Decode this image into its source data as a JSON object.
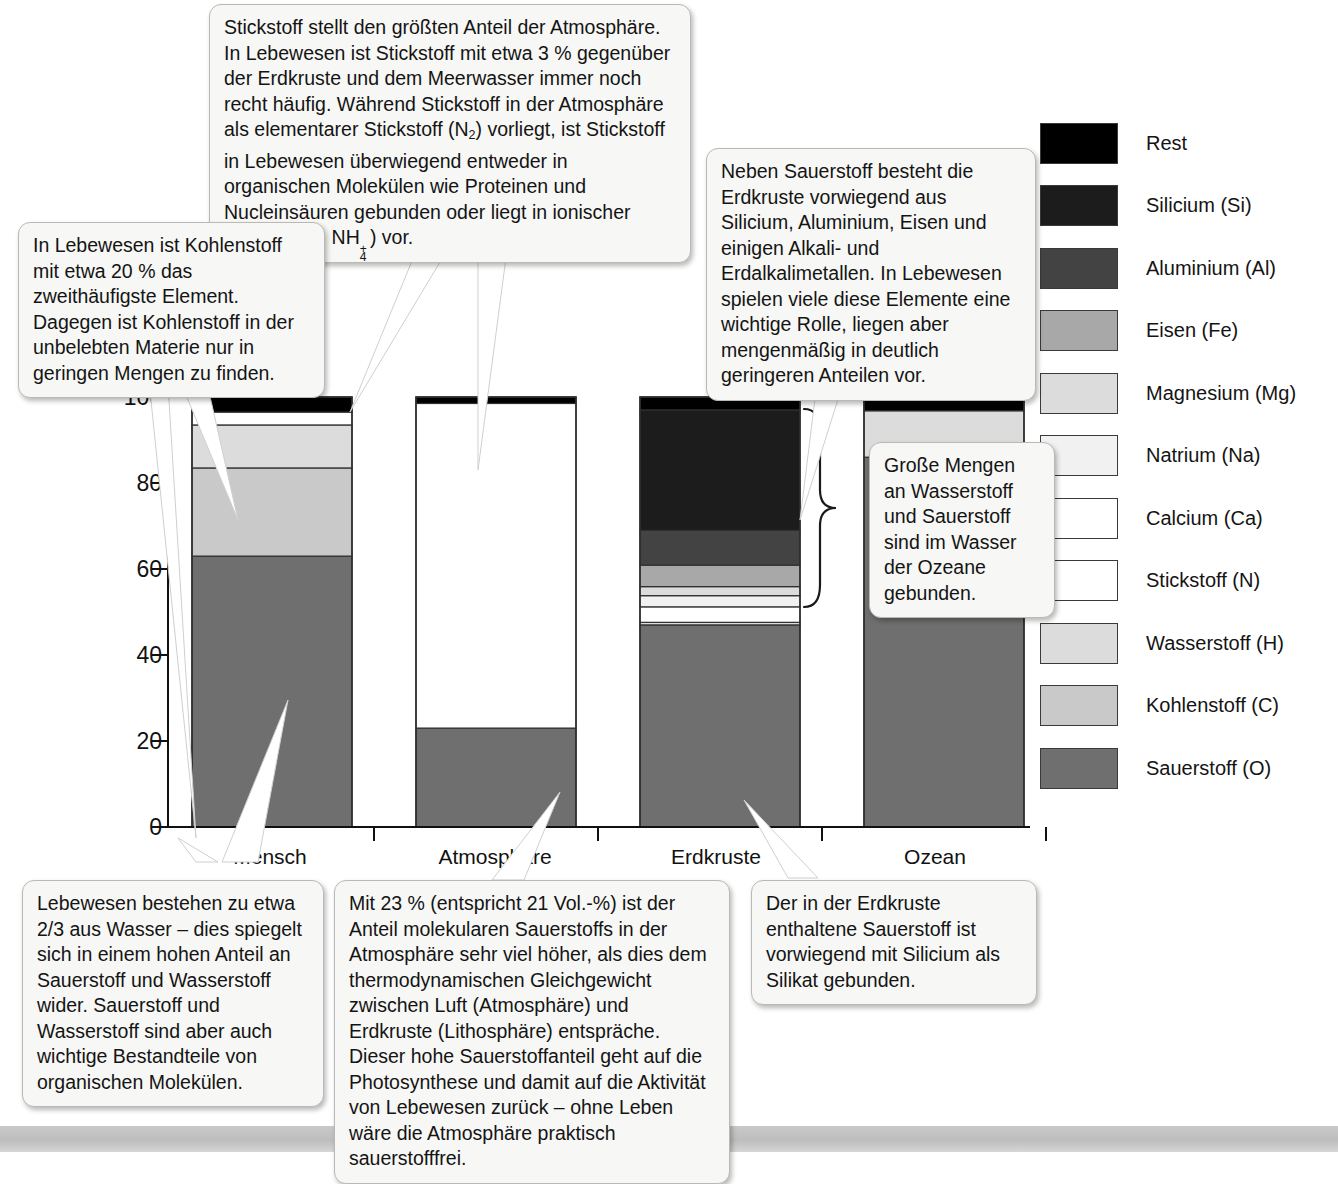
{
  "chart_data": {
    "type": "bar",
    "subtype": "stacked-100-percent",
    "title": "",
    "xlabel": "",
    "ylabel": "",
    "ylim": [
      0,
      100
    ],
    "yticks": [
      0,
      20,
      40,
      60,
      80,
      100
    ],
    "grid": false,
    "legend_position": "right",
    "categories": [
      "Mensch",
      "Atmosphäre",
      "Erdkruste",
      "Ozean"
    ],
    "series": [
      {
        "name": "Sauerstoff (O)",
        "color": "#6f6f6f",
        "values": [
          63.0,
          23.0,
          47.0,
          86.0
        ]
      },
      {
        "name": "Kohlenstoff (C)",
        "color": "#c9c9c9",
        "values": [
          20.5,
          0.0,
          0.0,
          0.0
        ]
      },
      {
        "name": "Wasserstoff (H)",
        "color": "#dcdcdc",
        "values": [
          10.0,
          0.0,
          0.6,
          10.8
        ]
      },
      {
        "name": "Stickstoff (N)",
        "color": "#ffffff",
        "values": [
          3.0,
          75.5,
          0.0,
          0.0
        ]
      },
      {
        "name": "Calcium (Ca)",
        "color": "#ffffff",
        "values": [
          0.0,
          0.0,
          3.6,
          0.0
        ]
      },
      {
        "name": "Natrium (Na)",
        "color": "#f1f1f1",
        "values": [
          0.0,
          0.0,
          2.6,
          0.0
        ]
      },
      {
        "name": "Magnesium (Mg)",
        "color": "#dcdcdc",
        "values": [
          0.0,
          0.0,
          2.1,
          0.0
        ]
      },
      {
        "name": "Eisen (Fe)",
        "color": "#a8a8a8",
        "values": [
          0.0,
          0.0,
          5.0,
          0.0
        ]
      },
      {
        "name": "Aluminium (Al)",
        "color": "#434343",
        "values": [
          0.0,
          0.0,
          8.1,
          0.0
        ]
      },
      {
        "name": "Silicium (Si)",
        "color": "#1c1c1c",
        "values": [
          0.0,
          0.0,
          28.0,
          0.0
        ]
      },
      {
        "name": "Rest",
        "color": "#000000",
        "values": [
          3.5,
          1.5,
          3.0,
          2.6
        ]
      }
    ]
  },
  "axis": {
    "y_ticks": [
      "100",
      "80",
      "60",
      "40",
      "20",
      "0"
    ],
    "categories": [
      "Mensch",
      "Atmosphäre",
      "Erdkruste",
      "Ozean"
    ]
  },
  "legend": {
    "items": [
      {
        "label": "Rest",
        "color": "#000000"
      },
      {
        "label": "Silicium (Si)",
        "color": "#1c1c1c"
      },
      {
        "label": "Aluminium (Al)",
        "color": "#434343"
      },
      {
        "label": "Eisen (Fe)",
        "color": "#a8a8a8"
      },
      {
        "label": "Magnesium (Mg)",
        "color": "#dcdcdc"
      },
      {
        "label": "Natrium (Na)",
        "color": "#f1f1f1"
      },
      {
        "label": "Calcium (Ca)",
        "color": "#ffffff"
      },
      {
        "label": "Stickstoff (N)",
        "color": "#ffffff"
      },
      {
        "label": "Wasserstoff (H)",
        "color": "#dcdcdc"
      },
      {
        "label": "Kohlenstoff (C)",
        "color": "#c9c9c9"
      },
      {
        "label": "Sauerstoff (O)",
        "color": "#6f6f6f"
      }
    ]
  },
  "callouts": {
    "nitrogen": {
      "part1": "Stickstoff stellt den größten Anteil der Atmosphäre. In Lebewesen ist Stickstoff mit etwa 3 % gegenüber der Erdkruste und dem Meerwasser immer noch recht häufig. Während Stickstoff in der Atmosphäre als elementarer Stickstoff (N",
      "n_sub": "2",
      "part2": ") vorliegt, ist Stickstoff in Lebewesen überwiegend entweder in organischen Molekülen wie Proteinen und Nucleinsäuren gebunden oder liegt in ionischer Form (NO",
      "no3_sub": "3",
      "no3_sup": "–",
      "part3": ", NH",
      "nh4_sub": "4",
      "nh4_sup": "+",
      "part4": ") vor."
    },
    "carbon": "In Lebewesen ist Kohlenstoff mit etwa 20 % das zweithäufigste Element. Dagegen ist Kohlenstoff in der unbelebten Materie nur in geringen Mengen zu finden.",
    "crust": "Neben Sauerstoff besteht die Erdkruste vorwiegend aus Silicium, Aluminium, Eisen und einigen Alkali- und Erdalkalimetallen. In Lebewesen spielen viele diese Elemente eine wichtige Rolle, liegen aber mengenmäßig in deutlich geringeren Anteilen vor.",
    "ocean": "Große Mengen an Wasserstoff und Sauerstoff sind im Wasser der Ozeane gebunden.",
    "water": "Lebewesen bestehen zu etwa 2/3 aus Wasser – dies spiegelt sich in einem hohen Anteil an Sauerstoff und Wasserstoff wider. Sauerstoff und Wasserstoff sind aber auch wichtige Bestandteile von organischen Molekülen.",
    "atmosphere": "Mit 23 % (entspricht 21 Vol.-%) ist der Anteil molekularen Sauerstoffs in der Atmosphäre sehr viel höher, als dies dem thermodynamischen Gleichgewicht zwischen Luft (Atmosphäre) und Erdkruste (Lithosphäre) entspräche. Dieser hohe Sauerstoffanteil geht auf die Photosynthese und damit auf die Aktivität von Lebewesen zurück – ohne Leben wäre die Atmosphäre praktisch sauerstofffrei.",
    "silicate": "Der in der Erdkruste enthaltene Sauerstoff ist vorwiegend mit Silicium als Silikat gebunden."
  }
}
